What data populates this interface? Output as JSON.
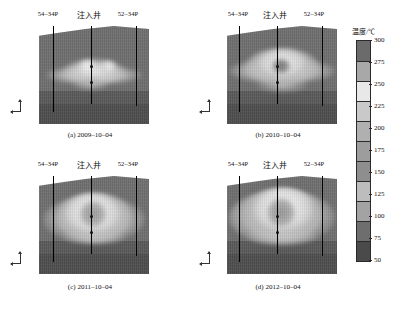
{
  "figure": {
    "type": "multi-panel-heatmap-figure",
    "background": "#ffffff",
    "panel_count": 4
  },
  "colorbar": {
    "title": "温度/℃",
    "unit": "℃",
    "min": 50,
    "max": 300,
    "step": 25,
    "orientation": "vertical",
    "ticks": [
      "300",
      "275",
      "250",
      "225",
      "200",
      "175",
      "150",
      "125",
      "100",
      "75",
      "50"
    ],
    "band_colors": [
      "#6b6b6b",
      "#a8a8a8",
      "#e8e8e8",
      "#c9c9c9",
      "#b0b0b0",
      "#9d9d9d",
      "#8e8e8e",
      "#bdbdbd",
      "#a3a3a3",
      "#6e6e6e",
      "#4a4a4a"
    ]
  },
  "labels": {
    "well_left": "54–34P",
    "well_center": "注入井",
    "well_right": "52–34P"
  },
  "panels": [
    {
      "id": "a",
      "caption": "(a)  2009–10–04",
      "date": "2009–10–04",
      "tag": "(a)"
    },
    {
      "id": "b",
      "caption": "(b)  2010–10–04",
      "date": "2010–10–04",
      "tag": "(b)"
    },
    {
      "id": "c",
      "caption": "(c)  2011–10–04",
      "date": "2011–10–04",
      "tag": "(c)"
    },
    {
      "id": "d",
      "caption": "(d)  2012–10–04",
      "date": "2012–10–04",
      "tag": "(d)"
    }
  ],
  "chart_data": {
    "type": "heatmap",
    "title": "",
    "xlabel": "",
    "ylabel": "",
    "colorbar_label": "温度/℃",
    "colorbar_range": [
      50,
      300
    ],
    "colorbar_step": 25,
    "colorbar_ticks": [
      300,
      275,
      250,
      225,
      200,
      175,
      150,
      125,
      100,
      75,
      50
    ],
    "legend_position": "right",
    "grid": false,
    "series": [
      {
        "name": "(a) 2009–10–04",
        "wells": [
          "54–34P",
          "注入井",
          "52–34P"
        ],
        "steam_chamber_description": "narrow flat horizontal hot band around the injection well, peak ~250–275 ℃",
        "peak_temperature": 275,
        "background_temperature": 75,
        "chamber_width_fraction": 0.55,
        "chamber_height_fraction": 0.22
      },
      {
        "name": "(b) 2010–10–04",
        "wells": [
          "54–34P",
          "注入井",
          "52–34P"
        ],
        "steam_chamber_description": "broadened lens with bright core above injection well, peak ~275 ℃",
        "peak_temperature": 275,
        "background_temperature": 75,
        "chamber_width_fraction": 0.65,
        "chamber_height_fraction": 0.34
      },
      {
        "name": "(c) 2011–10–04",
        "wells": [
          "54–34P",
          "注入井",
          "52–34P"
        ],
        "steam_chamber_description": "large rounded chamber with high temperature ring, peak ~300 ℃",
        "peak_temperature": 300,
        "background_temperature": 75,
        "chamber_width_fraction": 0.72,
        "chamber_height_fraction": 0.48
      },
      {
        "name": "(d) 2012–10–04",
        "wells": [
          "54–34P",
          "注入井",
          "52–34P"
        ],
        "steam_chamber_description": "fully developed chamber spanning both producers, peak ~300 ℃",
        "peak_temperature": 300,
        "background_temperature": 75,
        "chamber_width_fraction": 0.8,
        "chamber_height_fraction": 0.56
      }
    ]
  }
}
